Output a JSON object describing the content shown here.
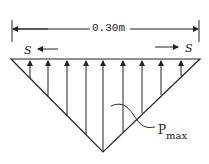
{
  "diagram": {
    "dimension_label": "0.30m",
    "shear_left": "S",
    "shear_right": "S",
    "pressure_label_main": "P",
    "pressure_label_sub": "max",
    "colors": {
      "line": "#222222",
      "background": "#ffffff"
    },
    "arrow_x": [
      30,
      48,
      67,
      86,
      103,
      123,
      142,
      161,
      181
    ]
  }
}
